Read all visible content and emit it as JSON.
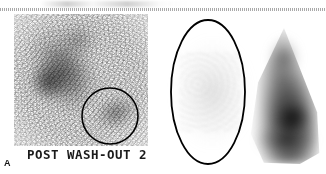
{
  "figure": {
    "panel_letter": "A",
    "modality": "planar-scintigraphy",
    "background_color": "#ffffff",
    "annotation_color": "#000000"
  },
  "top_artifact": {
    "name": "scan-edge-dotted-line",
    "style": "dotted",
    "color": "#9a9a9a"
  },
  "left_panel": {
    "name": "post-washout-scan",
    "burned_in_label": "POST WASH-OUT 2",
    "label_color": "#1a1a1a",
    "roi_annotation": {
      "shape": "circle",
      "cx": 110,
      "cy": 116,
      "r": 28,
      "stroke": "#000000",
      "stroke_width": 1.6
    }
  },
  "right_panel": {
    "name": "comparison-scan",
    "roi_annotation": {
      "shape": "ellipse",
      "cx": 208,
      "cy": 92,
      "rx": 37,
      "ry": 72,
      "stroke": "#000000",
      "stroke_width": 1.8
    }
  }
}
